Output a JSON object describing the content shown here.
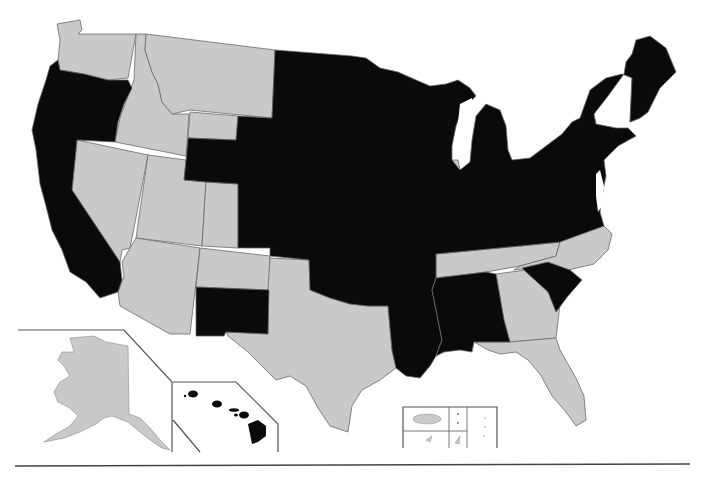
{
  "map": {
    "type": "choropleth",
    "region": "United States",
    "colors": {
      "highlighted": "#0a0a0a",
      "not_highlighted": "#c9c9c9",
      "border": "#6a6a6a",
      "background": "#ffffff"
    },
    "insets": [
      "Alaska",
      "Hawaii",
      "Territories (Puerto Rico, U.S. Virgin Islands, Guam, Northern Mariana Islands, American Samoa)"
    ],
    "states_highlighted": [
      "Oregon",
      "California",
      "Wyoming (south/east portion)",
      "Colorado (north/east portion)",
      "New Mexico (south portion)",
      "North Dakota",
      "South Dakota",
      "Nebraska",
      "Kansas",
      "Oklahoma",
      "Minnesota",
      "Iowa",
      "Missouri",
      "Arkansas",
      "Louisiana",
      "Mississippi",
      "Alabama",
      "Wisconsin",
      "Illinois",
      "Michigan",
      "Indiana",
      "Ohio",
      "Kentucky",
      "West Virginia",
      "Virginia",
      "Pennsylvania",
      "New York",
      "Vermont",
      "Maine",
      "Massachusetts",
      "Connecticut",
      "Rhode Island",
      "New Jersey",
      "Delaware",
      "Maryland",
      "South Carolina",
      "Hawaii"
    ],
    "states_not_highlighted": [
      "Washington",
      "Idaho",
      "Montana",
      "Nevada",
      "Utah",
      "Arizona",
      "Texas",
      "Tennessee",
      "North Carolina",
      "Georgia",
      "Florida",
      "New Hampshire",
      "Alaska",
      "Puerto Rico",
      "Guam",
      "U.S. Virgin Islands",
      "Northern Mariana Islands",
      "American Samoa"
    ]
  }
}
